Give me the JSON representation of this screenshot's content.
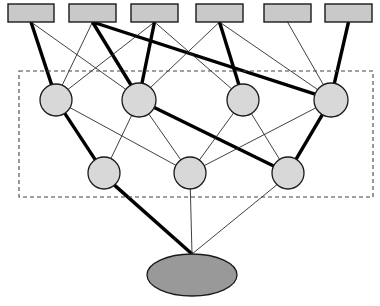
{
  "diagram": {
    "type": "layered-graph",
    "canvas": {
      "width": 380,
      "height": 306,
      "background": "#ffffff"
    },
    "colors": {
      "input_fill": "#c9c9c9",
      "hidden_fill": "#d8d8d8",
      "output_fill": "#999999",
      "node_stroke": "#1a1a1a",
      "edge_thin": "#2a2a2a",
      "edge_thick": "#000000",
      "group_box_stroke": "#444444"
    },
    "group_box": {
      "name": "hidden-layers-group",
      "x": 19,
      "y": 71,
      "width": 354,
      "height": 126,
      "dashed": true,
      "label": ""
    },
    "layers": [
      {
        "id": "input",
        "name": "input-layer",
        "shape": "rect",
        "label": "",
        "nodes": [
          {
            "id": "r1",
            "label": "",
            "x": 8,
            "y": 4,
            "w": 46,
            "h": 18
          },
          {
            "id": "r2",
            "label": "",
            "x": 69,
            "y": 4,
            "w": 47,
            "h": 18
          },
          {
            "id": "r3",
            "label": "",
            "x": 131,
            "y": 4,
            "w": 47,
            "h": 18
          },
          {
            "id": "r4",
            "label": "",
            "x": 196,
            "y": 4,
            "w": 47,
            "h": 18
          },
          {
            "id": "r5",
            "label": "",
            "x": 264,
            "y": 4,
            "w": 47,
            "h": 18
          },
          {
            "id": "r6",
            "label": "",
            "x": 325,
            "y": 4,
            "w": 47,
            "h": 18
          }
        ]
      },
      {
        "id": "hidden1",
        "name": "hidden-layer-1",
        "shape": "circle",
        "label": "",
        "nodes": [
          {
            "id": "c1",
            "label": "",
            "cx": 56,
            "cy": 100,
            "r": 16
          },
          {
            "id": "c2",
            "label": "",
            "cx": 139,
            "cy": 100,
            "r": 17
          },
          {
            "id": "c3",
            "label": "",
            "cx": 243,
            "cy": 100,
            "r": 16
          },
          {
            "id": "c4",
            "label": "",
            "cx": 331,
            "cy": 100,
            "r": 17
          }
        ]
      },
      {
        "id": "hidden2",
        "name": "hidden-layer-2",
        "shape": "circle",
        "label": "",
        "nodes": [
          {
            "id": "d1",
            "label": "",
            "cx": 104,
            "cy": 173,
            "r": 16
          },
          {
            "id": "d2",
            "label": "",
            "cx": 190,
            "cy": 173,
            "r": 16
          },
          {
            "id": "d3",
            "label": "",
            "cx": 288,
            "cy": 173,
            "r": 16
          }
        ]
      },
      {
        "id": "output",
        "name": "output-layer",
        "shape": "ellipse",
        "label": "",
        "nodes": [
          {
            "id": "o1",
            "label": "",
            "cx": 192,
            "cy": 275,
            "rx": 45,
            "ry": 21
          }
        ]
      }
    ],
    "edges": [
      {
        "from": "r1",
        "to": "c1",
        "weight": "strong"
      },
      {
        "from": "r1",
        "to": "c2",
        "weight": "weak"
      },
      {
        "from": "r2",
        "to": "c1",
        "weight": "weak"
      },
      {
        "from": "r2",
        "to": "c2",
        "weight": "strong"
      },
      {
        "from": "r2",
        "to": "c4",
        "weight": "strong"
      },
      {
        "from": "r3",
        "to": "c1",
        "weight": "weak"
      },
      {
        "from": "r3",
        "to": "c2",
        "weight": "strong"
      },
      {
        "from": "r3",
        "to": "c3",
        "weight": "weak"
      },
      {
        "from": "r4",
        "to": "c2",
        "weight": "weak"
      },
      {
        "from": "r4",
        "to": "c3",
        "weight": "strong"
      },
      {
        "from": "r4",
        "to": "c4",
        "weight": "weak"
      },
      {
        "from": "r5",
        "to": "c4",
        "weight": "weak"
      },
      {
        "from": "r6",
        "to": "c4",
        "weight": "strong"
      },
      {
        "from": "c1",
        "to": "d1",
        "weight": "strong"
      },
      {
        "from": "c1",
        "to": "d2",
        "weight": "weak"
      },
      {
        "from": "c2",
        "to": "d1",
        "weight": "weak"
      },
      {
        "from": "c2",
        "to": "d2",
        "weight": "weak"
      },
      {
        "from": "c2",
        "to": "d3",
        "weight": "strong"
      },
      {
        "from": "c3",
        "to": "d2",
        "weight": "weak"
      },
      {
        "from": "c3",
        "to": "d3",
        "weight": "weak"
      },
      {
        "from": "c4",
        "to": "d2",
        "weight": "weak"
      },
      {
        "from": "c4",
        "to": "d3",
        "weight": "strong"
      },
      {
        "from": "d1",
        "to": "o1",
        "weight": "strong"
      },
      {
        "from": "d2",
        "to": "o1",
        "weight": "weak"
      },
      {
        "from": "d3",
        "to": "o1",
        "weight": "weak"
      }
    ]
  }
}
